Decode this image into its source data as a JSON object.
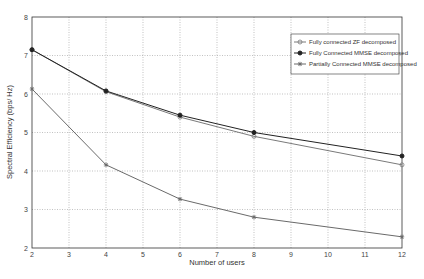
{
  "chart_data": {
    "type": "line",
    "title": "",
    "xlabel": "Number of users",
    "ylabel": "Spectral Efficiency (bps/ Hz)",
    "xlim": [
      2,
      12
    ],
    "ylim": [
      2,
      8
    ],
    "xticks": [
      2,
      3,
      4,
      5,
      6,
      7,
      8,
      9,
      10,
      11,
      12
    ],
    "yticks": [
      2,
      3,
      4,
      5,
      6,
      7,
      8
    ],
    "grid": true,
    "legend_position": "upper right",
    "x": [
      2,
      4,
      6,
      8,
      12
    ],
    "series": [
      {
        "name": "Fully connected ZF decomposed",
        "marker": "circle",
        "color": "#7a7a7a",
        "values": [
          7.15,
          6.06,
          5.4,
          4.9,
          4.16
        ]
      },
      {
        "name": "Fully Connected MMSE decomposed",
        "marker": "dot",
        "color": "#222222",
        "values": [
          7.15,
          6.08,
          5.45,
          5.0,
          4.39
        ]
      },
      {
        "name": "Partially Connected MMSE decomposed",
        "marker": "star",
        "color": "#6a6a6a",
        "values": [
          6.13,
          4.16,
          3.27,
          2.8,
          2.29
        ]
      }
    ]
  }
}
